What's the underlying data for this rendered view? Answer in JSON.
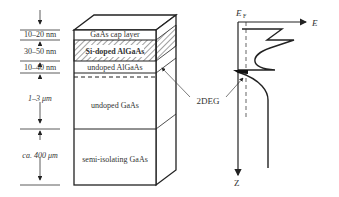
{
  "figure": {
    "type": "heterostructure-2DEG-diagram",
    "layers": [
      {
        "name": "GaAs cap layer",
        "thickness": "10–20 nm",
        "bold": false,
        "hatched": false
      },
      {
        "name": "Si-doped AlGaAs",
        "thickness": "30–50 nm",
        "bold": true,
        "hatched": true
      },
      {
        "name": "undoped AlGaAs",
        "thickness": "10–40 nm",
        "bold": false,
        "hatched": false
      },
      {
        "name": "undoped GaAs",
        "thickness": "1–3 μm",
        "bold": false,
        "hatched": false
      },
      {
        "name": "semi-isolating GaAs",
        "thickness": "ca. 400 μm",
        "bold": false,
        "hatched": false
      }
    ],
    "annotation": "2DEG",
    "band_diagram": {
      "fermi_label": "E",
      "fermi_sub": "F",
      "energy_axis": "E",
      "depth_axis": "Z"
    },
    "colors": {
      "line": "#222222",
      "text": "#333333",
      "background": "#ffffff"
    }
  }
}
